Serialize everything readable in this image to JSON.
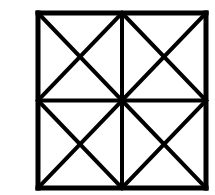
{
  "figure": {
    "label": "C",
    "caption_position": "top-left",
    "background_color": "#ffffff",
    "stroke_color": "#000000",
    "label_color": "#1a1a1a"
  },
  "chart_data": {
    "type": "diagram",
    "title": "C",
    "subtitle": "",
    "xlabel": "",
    "ylabel": "",
    "canvas": {
      "width": 215,
      "height": 195
    },
    "square": {
      "x_min": 38,
      "y_min": 13,
      "x_max": 206,
      "y_max": 188,
      "width": 168,
      "height": 175,
      "border_stroke_width": 5
    },
    "grid": {
      "vertical_midline_x": 122,
      "horizontal_midline_y": 100.5,
      "rows": 2,
      "columns": 2,
      "stroke_width": 4
    },
    "quadrants": [
      {
        "name": "top-left",
        "x_min": 38,
        "y_min": 13,
        "x_max": 122,
        "y_max": 100.5,
        "diagonals": [
          "main",
          "anti"
        ]
      },
      {
        "name": "top-right",
        "x_min": 122,
        "y_min": 13,
        "x_max": 206,
        "y_max": 100.5,
        "diagonals": [
          "main",
          "anti"
        ]
      },
      {
        "name": "bottom-left",
        "x_min": 38,
        "y_min": 100.5,
        "x_max": 122,
        "y_max": 188,
        "diagonals": [
          "main",
          "anti"
        ]
      },
      {
        "name": "bottom-right",
        "x_min": 122,
        "y_min": 100.5,
        "x_max": 206,
        "y_max": 188,
        "diagonals": [
          "main",
          "anti"
        ]
      }
    ],
    "segments": [
      {
        "id": "border-top",
        "x1": 38,
        "y1": 13,
        "x2": 206,
        "y2": 13
      },
      {
        "id": "border-right",
        "x1": 206,
        "y1": 13,
        "x2": 206,
        "y2": 188
      },
      {
        "id": "border-bottom",
        "x1": 206,
        "y1": 188,
        "x2": 38,
        "y2": 188
      },
      {
        "id": "border-left",
        "x1": 38,
        "y1": 188,
        "x2": 38,
        "y2": 13
      },
      {
        "id": "midline-vertical",
        "x1": 122,
        "y1": 13,
        "x2": 122,
        "y2": 188
      },
      {
        "id": "midline-horizontal",
        "x1": 38,
        "y1": 100.5,
        "x2": 206,
        "y2": 100.5
      },
      {
        "id": "tl-diag-main",
        "x1": 38,
        "y1": 13,
        "x2": 122,
        "y2": 100.5
      },
      {
        "id": "tl-diag-anti",
        "x1": 122,
        "y1": 13,
        "x2": 38,
        "y2": 100.5
      },
      {
        "id": "tr-diag-main",
        "x1": 122,
        "y1": 13,
        "x2": 206,
        "y2": 100.5
      },
      {
        "id": "tr-diag-anti",
        "x1": 206,
        "y1": 13,
        "x2": 122,
        "y2": 100.5
      },
      {
        "id": "bl-diag-main",
        "x1": 38,
        "y1": 100.5,
        "x2": 122,
        "y2": 188
      },
      {
        "id": "bl-diag-anti",
        "x1": 122,
        "y1": 100.5,
        "x2": 38,
        "y2": 188
      },
      {
        "id": "br-diag-main",
        "x1": 122,
        "y1": 100.5,
        "x2": 206,
        "y2": 188
      },
      {
        "id": "br-diag-anti",
        "x1": 206,
        "y1": 100.5,
        "x2": 122,
        "y2": 188
      }
    ],
    "junctions": [
      {
        "name": "center",
        "x": 122,
        "y": 100.5,
        "degree": 8
      },
      {
        "name": "top-edge-midpoint",
        "x": 122,
        "y": 13,
        "degree": 5
      },
      {
        "name": "bottom-edge-midpoint",
        "x": 122,
        "y": 188,
        "degree": 5
      },
      {
        "name": "left-edge-midpoint",
        "x": 38,
        "y": 100.5,
        "degree": 5
      },
      {
        "name": "right-edge-midpoint",
        "x": 206,
        "y": 100.5,
        "degree": 5
      }
    ],
    "legend": [],
    "grid_visible": true
  }
}
